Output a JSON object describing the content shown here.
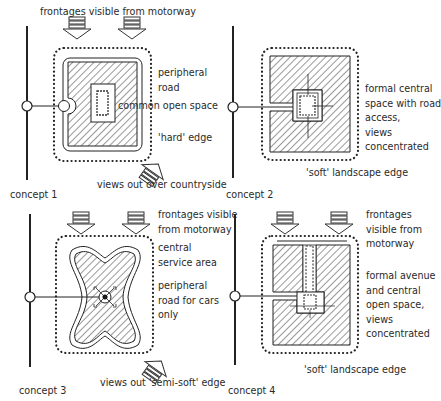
{
  "concepts": [
    {
      "label": "concept 1",
      "annotations": {
        "top": "frontages visible from motorway",
        "road": "peripheral\nroad",
        "open_space": "common open space",
        "edge": "'hard' edge",
        "views": "views out over countryside"
      }
    },
    {
      "label": "concept 2",
      "annotations": {
        "central": "formal central\nspace with road\naccess,\nviews\nconcentrated",
        "edge": "'soft' landscape edge"
      }
    },
    {
      "label": "concept 3",
      "annotations": {
        "top": "frontages visible\nfrom motorway",
        "service": "central\nservice area",
        "road": "peripheral\nroad for cars\nonly",
        "views": "views out 'semi-soft' edge"
      }
    },
    {
      "label": "concept 4",
      "annotations": {
        "top": "frontages\nvisible from\nmotorway",
        "avenue": "formal avenue\nand central\nopen space,\nviews\nconcentrated",
        "edge": "'soft' landscape edge"
      }
    }
  ],
  "colors": {
    "ink": "#222222",
    "background": "#ffffff"
  }
}
